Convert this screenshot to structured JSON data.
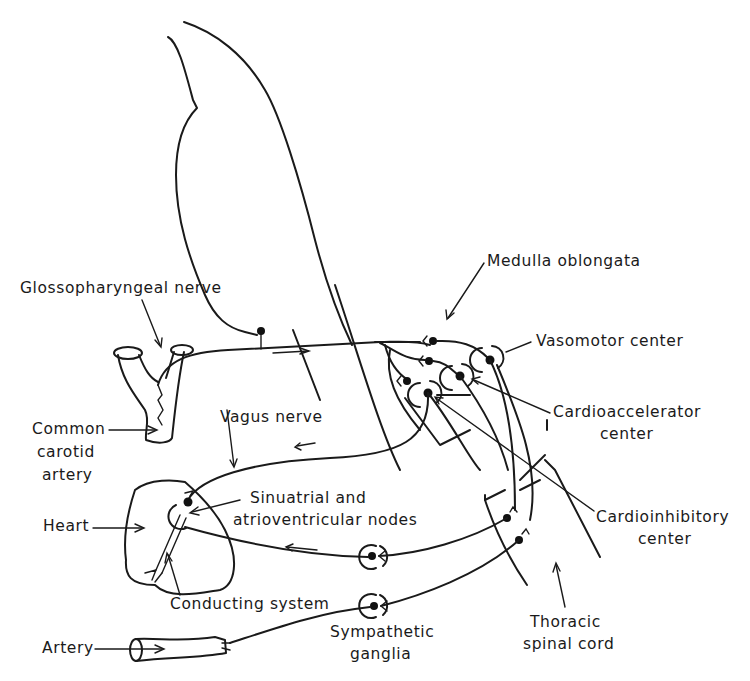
{
  "diagram": {
    "type": "anatomical-schematic",
    "labels": {
      "medulla": "Medulla oblongata",
      "glossopharyngeal": "Glossopharyngeal nerve",
      "vasomotor": "Vasomotor center",
      "common_carotid_1": "Common",
      "common_carotid_2": "carotid",
      "common_carotid_3": "artery",
      "cardioaccelerator_1": "Cardioaccelerator",
      "cardioaccelerator_2": "center",
      "vagus": "Vagus nerve",
      "sinuatrial_1": "Sinuatrial and",
      "sinuatrial_2": "atrioventricular nodes",
      "heart": "Heart",
      "cardioinhibitory_1": "Cardioinhibitory",
      "cardioinhibitory_2": "center",
      "conducting": "Conducting system",
      "artery": "Artery",
      "sympathetic_1": "Sympathetic",
      "sympathetic_2": "ganglia",
      "thoracic_1": "Thoracic",
      "thoracic_2": "spinal cord"
    },
    "colors": {
      "line": "#1a1a1a",
      "background": "#ffffff"
    }
  }
}
